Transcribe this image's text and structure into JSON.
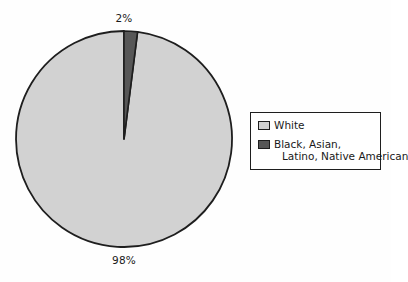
{
  "chart_data": {
    "type": "pie",
    "title": "",
    "categories": [
      "White",
      "Black, Asian, Latino, Native American"
    ],
    "values": [
      98,
      2
    ],
    "value_labels": [
      "98%",
      "2%"
    ],
    "units": "percent",
    "start_angle_deg": 90,
    "direction": "counterclockwise",
    "legend_position": "right",
    "grid": false,
    "colors": [
      "#d2d2d2",
      "#575757"
    ],
    "outline_color": "#1e1e1e"
  },
  "labels": {
    "minor_slice": "2%",
    "major_slice": "98%"
  },
  "legend": {
    "entries": [
      {
        "label": "White",
        "label_line1": "White",
        "label_line2": "",
        "color": "#d2d2d2"
      },
      {
        "label": "Black, Asian, Latino, Native American",
        "label_line1": "Black, Asian,",
        "label_line2": "Latino, Native American",
        "color": "#575757"
      }
    ]
  },
  "colors": {
    "background": "#fefefe",
    "major_slice": "#d2d2d2",
    "minor_slice": "#575757",
    "outline": "#1e1e1e",
    "text": "#1a1a1a"
  }
}
